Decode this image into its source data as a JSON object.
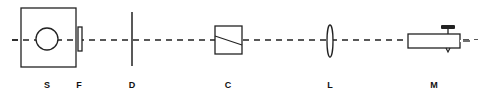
{
  "diagram": {
    "type": "optical bench setup",
    "components": [
      {
        "id": "S",
        "label": "S",
        "shape": "box with circular source"
      },
      {
        "id": "F",
        "label": "F",
        "shape": "filter plate"
      },
      {
        "id": "D",
        "label": "D",
        "shape": "vertical aperture/diaphragm"
      },
      {
        "id": "C",
        "label": "C",
        "shape": "square cell with diagonal"
      },
      {
        "id": "L",
        "label": "L",
        "shape": "lens"
      },
      {
        "id": "M",
        "label": "M",
        "shape": "microscope/telescope tube"
      }
    ],
    "colors": {
      "line": "#222222",
      "background": "#ffffff"
    }
  }
}
